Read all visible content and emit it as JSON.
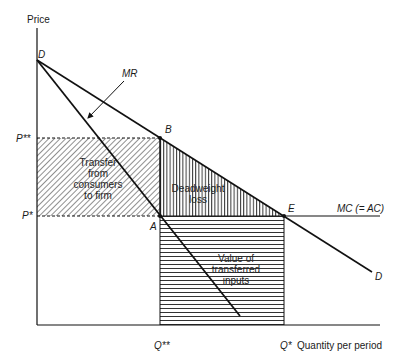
{
  "figure": {
    "axes": {
      "y_label": "Price",
      "x_label": "Quantity per period"
    },
    "price_levels": [
      {
        "id": "p_star_star",
        "label": "P**"
      },
      {
        "id": "p_star",
        "label": "P*"
      }
    ],
    "quantity_levels": [
      {
        "id": "q_star_star",
        "label": "Q**"
      },
      {
        "id": "q_star",
        "label": "Q*"
      }
    ],
    "points": {
      "D": "D",
      "B": "B",
      "A": "A",
      "E": "E"
    },
    "curves": {
      "demand": "D",
      "marginal_revenue": "MR",
      "marginal_cost": "MC (= AC)"
    },
    "regions": {
      "transfer": [
        "Transfer",
        "from",
        "consumers",
        "to firm"
      ],
      "deadweight": [
        "Deadweight",
        "loss"
      ],
      "transferred_inputs": [
        "Value of",
        "transferred",
        "inputs"
      ]
    },
    "colors": {
      "line": "#111111",
      "hatch": "#333333",
      "background": "#ffffff"
    }
  }
}
